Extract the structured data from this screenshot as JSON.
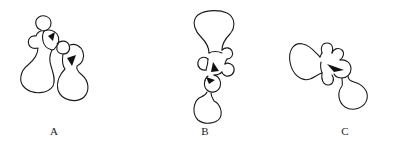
{
  "figure": {
    "panels": [
      {
        "id": "A",
        "label": "A",
        "description": "Two bilobed molecule outlines joined diagonally, each with a small black wedge at the junction"
      },
      {
        "id": "B",
        "label": "B",
        "description": "Vertically oriented molecule with large top lobe, four small side lobes, two black wedges, and a lower lobe"
      },
      {
        "id": "C",
        "label": "C",
        "description": "Horizontally oriented molecule with large left lobe, small lobes on top and bottom, a black wedge, and a lower-right lobe"
      }
    ],
    "colors": {
      "stroke": "#1a1a1a",
      "wedge": "#111111",
      "background": "#ffffff"
    }
  }
}
